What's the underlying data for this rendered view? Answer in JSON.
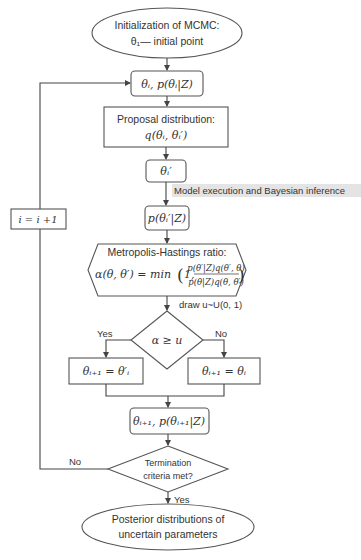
{
  "diagram": {
    "nodes": {
      "start": {
        "line1": "Initialization of MCMC:",
        "line2": "θ₁— initial point"
      },
      "current_state": {
        "text": "θᵢ, p(θᵢ|Z)"
      },
      "proposal": {
        "line1": "Proposal distribution:",
        "line2": "q(θᵢ, θᵢ′)"
      },
      "candidate": {
        "text": "θᵢ′"
      },
      "model_exec_note": {
        "text": "Model execution and Bayesian inference"
      },
      "posterior_candidate": {
        "text": "p(θᵢ′|Z)"
      },
      "mh_ratio": {
        "line1": "Metropolis-Hastings ratio:",
        "lhs": "α(θ, θ′) = min",
        "paren_open": "(",
        "one": "1,",
        "numerator": "p(θ′|Z)q(θ′, θ)",
        "denominator": "p(θ|Z)q(θ, θ′)",
        "paren_close": ")"
      },
      "draw_note": {
        "text": "draw u~U(0, 1)"
      },
      "accept_decision": {
        "text": "α ≥ u",
        "yes": "Yes",
        "no": "No"
      },
      "accept_box": {
        "text": "θᵢ₊₁ = θ′ᵢ"
      },
      "reject_box": {
        "text": "θᵢ₊₁ = θᵢ"
      },
      "next_state": {
        "text": "θᵢ₊₁, p(θᵢ₊₁|Z)"
      },
      "termination": {
        "line1": "Termination",
        "line2": "criteria met?",
        "yes": "Yes",
        "no": "No"
      },
      "increment": {
        "text": "i = i +1"
      },
      "end": {
        "line1": "Posterior distributions of",
        "line2": "uncertain parameters"
      }
    },
    "colors": {
      "stroke": "#555555",
      "text": "#333333",
      "note_highlight": "#e4e4e4",
      "background": "#ffffff"
    }
  }
}
